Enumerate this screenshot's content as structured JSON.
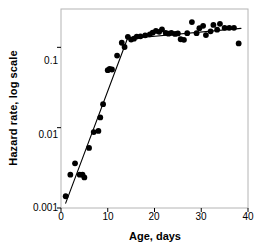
{
  "chart_data": {
    "type": "scatter",
    "title": "",
    "xlabel": "Age, days",
    "ylabel": "Hazard rate, log scale",
    "yscale": "log",
    "xlim": [
      0,
      40
    ],
    "ylim": [
      0.001,
      0.3
    ],
    "xticks": [
      0,
      10,
      20,
      30,
      40
    ],
    "xtick_labels": [
      "0",
      "10",
      "20",
      "30",
      "40"
    ],
    "yticks": [
      0.001,
      0.01,
      0.1
    ],
    "ytick_labels": [
      "0.001",
      "0.01",
      "0.1"
    ],
    "grid": false,
    "legend": null,
    "marker": "filled-circle",
    "marker_color": "#000000",
    "line_color": "#000000",
    "frame_color": "#b0b0b0",
    "x": [
      1,
      2,
      3,
      4,
      4.6,
      5,
      6,
      7,
      8,
      8.4,
      9,
      10,
      10.4,
      10.9,
      12,
      13,
      13.6,
      14.3,
      15,
      15.6,
      16.2,
      17,
      18,
      19,
      19.6,
      20.3,
      21,
      21.6,
      22.4,
      23,
      23.6,
      24.4,
      25,
      25.6,
      26.3,
      27,
      28,
      29,
      29.6,
      30.4,
      31,
      32,
      32.6,
      33.4,
      34,
      35,
      36,
      37,
      38
    ],
    "y": [
      0.0014,
      0.0026,
      0.0036,
      0.0026,
      0.0026,
      0.0024,
      0.0056,
      0.0088,
      0.0091,
      0.0134,
      0.0196,
      0.052,
      0.054,
      0.053,
      0.079,
      0.114,
      0.101,
      0.135,
      0.125,
      0.128,
      0.136,
      0.137,
      0.141,
      0.145,
      0.152,
      0.16,
      0.156,
      0.167,
      0.151,
      0.148,
      0.151,
      0.147,
      0.149,
      0.126,
      0.124,
      0.15,
      0.206,
      0.15,
      0.173,
      0.185,
      0.142,
      0.158,
      0.19,
      0.166,
      0.196,
      0.175,
      0.175,
      0.175,
      0.112
    ],
    "fit_line": {
      "description": "two-segment piecewise fit: steep log-linear rise then near-flat plateau",
      "segments": [
        {
          "x0": 1.0,
          "y0": 0.00115,
          "x1": 14.2,
          "y1": 0.128
        },
        {
          "x0": 14.2,
          "y0": 0.128,
          "x1": 38.5,
          "y1": 0.172
        }
      ]
    }
  },
  "axes": {
    "xlabel": "Age, days",
    "ylabel": "Hazard rate, log scale"
  }
}
